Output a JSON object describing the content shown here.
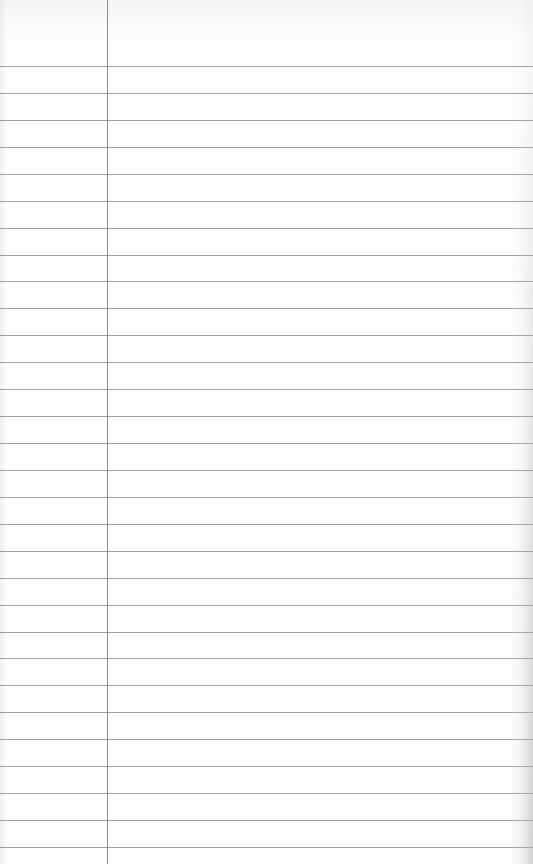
{
  "paper": {
    "type": "lined notebook paper",
    "background_color": "#fdfdfd",
    "rule_color": "#8e8e8e",
    "margin_line_color": "#8a8a8a",
    "margin_line_x": 107,
    "first_rule_y": 66,
    "rule_spacing": 26.93,
    "rule_count": 30,
    "text": ""
  }
}
